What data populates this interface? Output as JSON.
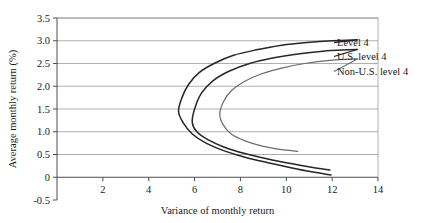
{
  "chart_data": {
    "type": "line",
    "title": "",
    "xlabel": "Variance of monthly return",
    "ylabel": "Average monthly return (%)",
    "xlim": [
      0,
      14
    ],
    "ylim": [
      -0.5,
      3.5
    ],
    "xticks": [
      "0",
      "2",
      "4",
      "6",
      "8",
      "10",
      "12",
      "14"
    ],
    "xtick_values": [
      0,
      2,
      4,
      6,
      8,
      10,
      12,
      14
    ],
    "yticks": [
      "-0.5",
      "0",
      "0.5",
      "1.0",
      "1.5",
      "2.0",
      "2.5",
      "3.0",
      "3.5"
    ],
    "ytick_values": [
      -0.5,
      0,
      0.5,
      1.0,
      1.5,
      2.0,
      2.5,
      3.0,
      3.5
    ],
    "grid": "horizontal",
    "legend_position": "right-inline-annotations",
    "series": [
      {
        "name": "Level 4",
        "color": "#262626",
        "width": 1.5,
        "vertex": {
          "x": 5.3,
          "y": 1.45
        },
        "upper_branch": [
          [
            5.3,
            1.45
          ],
          [
            5.45,
            1.75
          ],
          [
            5.75,
            2.05
          ],
          [
            6.2,
            2.3
          ],
          [
            6.85,
            2.5
          ],
          [
            7.7,
            2.68
          ],
          [
            8.7,
            2.8
          ],
          [
            9.8,
            2.9
          ],
          [
            10.9,
            2.96
          ],
          [
            12.0,
            3.0
          ],
          [
            13.1,
            3.02
          ]
        ],
        "lower_branch": [
          [
            5.3,
            1.45
          ],
          [
            5.5,
            1.2
          ],
          [
            5.9,
            0.95
          ],
          [
            6.5,
            0.75
          ],
          [
            7.3,
            0.58
          ],
          [
            8.2,
            0.44
          ],
          [
            9.2,
            0.32
          ],
          [
            10.2,
            0.21
          ],
          [
            11.1,
            0.12
          ],
          [
            11.95,
            0.05
          ]
        ],
        "label_anchor": {
          "x": 13.1,
          "y": 3.02
        }
      },
      {
        "name": "U.S. level 4",
        "color": "#262626",
        "width": 1.5,
        "vertex": {
          "x": 5.9,
          "y": 1.2
        },
        "upper_branch": [
          [
            5.9,
            1.2
          ],
          [
            6.0,
            1.5
          ],
          [
            6.3,
            1.85
          ],
          [
            6.8,
            2.12
          ],
          [
            7.5,
            2.33
          ],
          [
            8.4,
            2.5
          ],
          [
            9.4,
            2.62
          ],
          [
            10.5,
            2.71
          ],
          [
            11.6,
            2.77
          ],
          [
            12.7,
            2.8
          ],
          [
            13.1,
            2.81
          ]
        ],
        "lower_branch": [
          [
            5.9,
            1.2
          ],
          [
            6.1,
            1.0
          ],
          [
            6.6,
            0.82
          ],
          [
            7.3,
            0.66
          ],
          [
            8.2,
            0.52
          ],
          [
            9.2,
            0.4
          ],
          [
            10.2,
            0.3
          ],
          [
            11.1,
            0.22
          ],
          [
            11.9,
            0.16
          ]
        ],
        "label_anchor": {
          "x": 13.1,
          "y": 2.81
        }
      },
      {
        "name": "Non-U.S. level 4",
        "color": "#6b6b6b",
        "width": 1.2,
        "vertex": {
          "x": 7.1,
          "y": 1.38
        },
        "upper_branch": [
          [
            7.1,
            1.38
          ],
          [
            7.25,
            1.65
          ],
          [
            7.6,
            1.9
          ],
          [
            8.15,
            2.1
          ],
          [
            8.9,
            2.27
          ],
          [
            9.8,
            2.4
          ],
          [
            10.8,
            2.5
          ],
          [
            11.9,
            2.57
          ],
          [
            13.0,
            2.6
          ],
          [
            13.1,
            2.6
          ]
        ],
        "lower_branch": [
          [
            7.1,
            1.38
          ],
          [
            7.25,
            1.15
          ],
          [
            7.6,
            0.95
          ],
          [
            8.2,
            0.8
          ],
          [
            9.0,
            0.68
          ],
          [
            9.9,
            0.6
          ],
          [
            10.5,
            0.57
          ]
        ],
        "label_anchor": {
          "x": 13.1,
          "y": 2.6
        }
      }
    ]
  },
  "axes": {
    "x_title": "Variance of monthly return",
    "y_title": "Average monthly return (%)",
    "x_tick_labels": [
      "0",
      "2",
      "4",
      "6",
      "8",
      "10",
      "12",
      "14"
    ],
    "y_tick_labels": [
      "3.5",
      "3.0",
      "2.5",
      "2.0",
      "1.5",
      "1.0",
      "0.5",
      "0",
      "-0.5"
    ]
  },
  "legend": {
    "items": [
      {
        "label": "Level 4"
      },
      {
        "label": "U.S. level 4"
      },
      {
        "label": "Non-U.S. level 4"
      }
    ]
  },
  "colors": {
    "grid": "#8c8c8c",
    "axis": "#4d4d4d",
    "curve_dark": "#262626",
    "curve_light": "#6b6b6b",
    "background": "#ffffff"
  }
}
